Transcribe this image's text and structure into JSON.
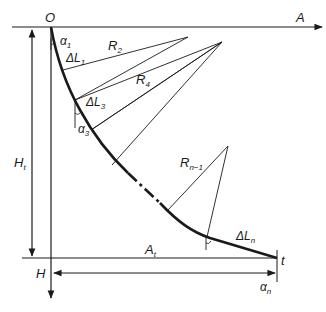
{
  "diagram": {
    "type": "well-trajectory-profile",
    "colors": {
      "line": "#1a1a1a",
      "background": "#ffffff"
    },
    "labels": {
      "origin": "O",
      "horizontal_axis": "A",
      "vertical_axis": "H",
      "target": "t",
      "total_depth": {
        "main": "H",
        "sub": "t"
      },
      "total_displacement": {
        "main": "A",
        "sub": "t"
      },
      "alpha_1": {
        "main": "α",
        "sub": "1"
      },
      "alpha_3": {
        "main": "α",
        "sub": "3"
      },
      "alpha_n": {
        "main": "α",
        "sub": "n"
      },
      "dL_1": {
        "main": "ΔL",
        "sub": "1"
      },
      "dL_3": {
        "main": "ΔL",
        "sub": "3"
      },
      "dL_n": {
        "main": "ΔL",
        "sub": "n"
      },
      "R_2": {
        "main": "R",
        "sub": "2"
      },
      "R_4": {
        "main": "R",
        "sub": "4"
      },
      "R_n1": {
        "main": "R",
        "sub": "n−1"
      }
    }
  }
}
